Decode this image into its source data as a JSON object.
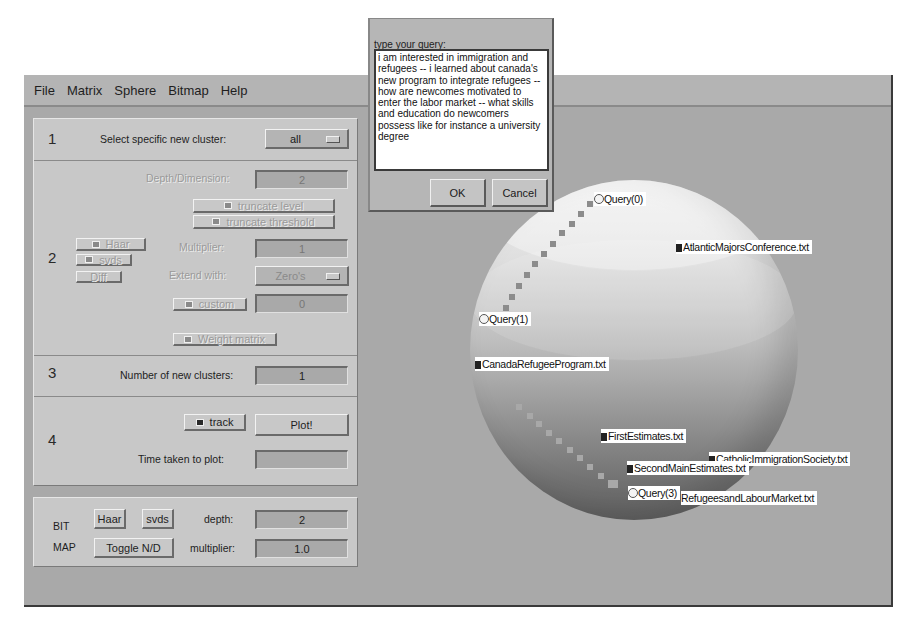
{
  "menubar": {
    "items": [
      "File",
      "Matrix",
      "Sphere",
      "Bitmap",
      "Help"
    ]
  },
  "controls": {
    "section1": {
      "number": "1",
      "label": "Select specific new cluster:",
      "cluster_select": "all"
    },
    "section2": {
      "number": "2",
      "depth_label": "Depth/Dimension:",
      "depth_value": "2",
      "truncate_level": "truncate level",
      "truncate_threshold": "truncate threshold",
      "haar": "Haar",
      "svds": "svds",
      "diff": "Diff",
      "multiplier_label": "Multiplier:",
      "multiplier_value": "1",
      "extend_label": "Extend with:",
      "extend_value": "Zero's",
      "custom": "custom",
      "custom_value": "0",
      "weight_matrix": "Weight matrix"
    },
    "section3": {
      "number": "3",
      "label": "Number of new clusters:",
      "value": "1"
    },
    "section4": {
      "number": "4",
      "track": "track",
      "plot": "Plot!",
      "time_label": "Time taken to plot:",
      "time_value": ""
    },
    "bitmap": {
      "label_bit": "BIT",
      "label_map": "MAP",
      "haar": "Haar",
      "svds": "svds",
      "toggle": "Toggle N/D",
      "depth_label": "depth:",
      "depth_value": "2",
      "multiplier_label": "multiplier:",
      "multiplier_value": "1.0"
    }
  },
  "sphere": {
    "labels": {
      "q0": "Query(0)",
      "q1": "Query(1)",
      "q3": "Query(3)",
      "d1": "AtlanticMajorsConference.txt",
      "d2": "CanadaRefugeeProgram.txt",
      "d3": "FirstEstimates.txt",
      "d4": "CatholicImmigrationSociety.txt",
      "d5": "SecondMainEstimates.txt",
      "d6": "RefugeesandLabourMarket.txt"
    }
  },
  "dialog": {
    "prompt": "type your query:",
    "query": "i am interested in immigration and refugees -- i learned about canada's new program to integrate refugees -- how are newcomes motivated to enter the labor market -- what skills and education do newcomers possess like for instance a university degree",
    "ok": "OK",
    "cancel": "Cancel"
  }
}
